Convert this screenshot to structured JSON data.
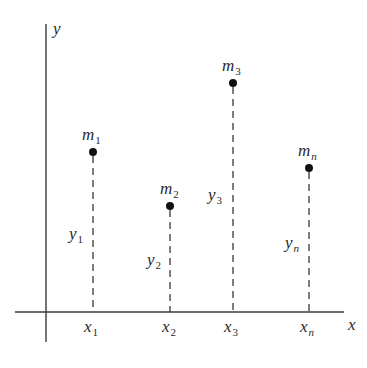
{
  "diagram": {
    "axes": {
      "x_label": "x",
      "y_label": "y",
      "color": "#3a3a3a"
    },
    "points": [
      {
        "mass_base": "m",
        "mass_sub": "1",
        "y_base": "y",
        "y_sub": "1",
        "x_base": "x",
        "x_sub": "1",
        "sub_italic": false
      },
      {
        "mass_base": "m",
        "mass_sub": "2",
        "y_base": "y",
        "y_sub": "2",
        "x_base": "x",
        "x_sub": "2",
        "sub_italic": false
      },
      {
        "mass_base": "m",
        "mass_sub": "3",
        "y_base": "y",
        "y_sub": "3",
        "x_base": "x",
        "x_sub": "3",
        "sub_italic": false
      },
      {
        "mass_base": "m",
        "mass_sub": "n",
        "y_base": "y",
        "y_sub": "n",
        "x_base": "x",
        "x_sub": "n",
        "sub_italic": true
      }
    ],
    "dot_color": "#111111",
    "dash_color": "#3a3a3a"
  }
}
